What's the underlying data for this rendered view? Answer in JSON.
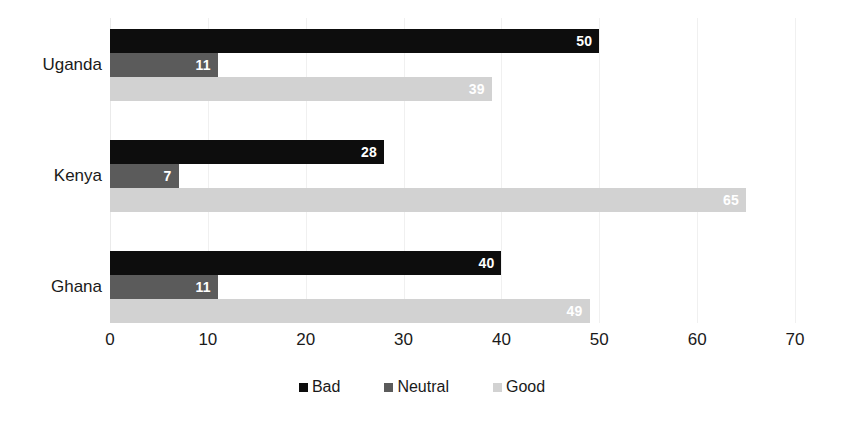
{
  "chart_data": {
    "type": "bar",
    "orientation": "horizontal",
    "title": "",
    "subtitle": "",
    "xlabel": "",
    "ylabel": "",
    "categories": [
      "Uganda",
      "Kenya",
      "Ghana"
    ],
    "series": [
      {
        "name": "Bad",
        "color": "#0d0d0d",
        "values": [
          50,
          28,
          40
        ]
      },
      {
        "name": "Neutral",
        "color": "#5b5b5b",
        "values": [
          11,
          7,
          11
        ]
      },
      {
        "name": "Good",
        "color": "#d2d2d2",
        "values": [
          39,
          65,
          49
        ]
      }
    ],
    "xlim": [
      0,
      70
    ],
    "xticks": [
      0,
      10,
      20,
      30,
      40,
      50,
      60,
      70
    ],
    "xtick_labels": [
      "0",
      "10",
      "20",
      "30",
      "40",
      "50",
      "60",
      "70"
    ],
    "grid": true,
    "grid_axis": "x",
    "legend_position": "bottom",
    "data_labels": true
  },
  "axis": {
    "ticks": [
      {
        "value": 0,
        "label": "0"
      },
      {
        "value": 10,
        "label": "10"
      },
      {
        "value": 20,
        "label": "20"
      },
      {
        "value": 30,
        "label": "30"
      },
      {
        "value": 40,
        "label": "40"
      },
      {
        "value": 50,
        "label": "50"
      },
      {
        "value": 60,
        "label": "60"
      },
      {
        "value": 70,
        "label": "70"
      }
    ]
  },
  "groups": [
    {
      "label": "Uganda",
      "bars": [
        {
          "series": "Bad",
          "value": 50,
          "label": "50"
        },
        {
          "series": "Neutral",
          "value": 11,
          "label": "11"
        },
        {
          "series": "Good",
          "value": 39,
          "label": "39"
        }
      ]
    },
    {
      "label": "Kenya",
      "bars": [
        {
          "series": "Bad",
          "value": 28,
          "label": "28"
        },
        {
          "series": "Neutral",
          "value": 7,
          "label": "7"
        },
        {
          "series": "Good",
          "value": 65,
          "label": "65"
        }
      ]
    },
    {
      "label": "Ghana",
      "bars": [
        {
          "series": "Bad",
          "value": 40,
          "label": "40"
        },
        {
          "series": "Neutral",
          "value": 11,
          "label": "11"
        },
        {
          "series": "Good",
          "value": 49,
          "label": "49"
        }
      ]
    }
  ],
  "legend": {
    "items": [
      {
        "label": "Bad",
        "color": "#0d0d0d"
      },
      {
        "label": "Neutral",
        "color": "#5b5b5b"
      },
      {
        "label": "Good",
        "color": "#d2d2d2"
      }
    ]
  }
}
